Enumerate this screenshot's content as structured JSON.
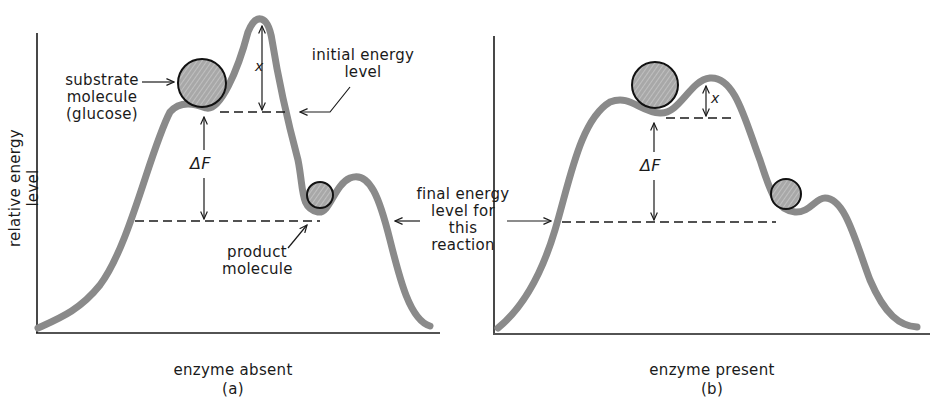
{
  "figure": {
    "y_axis_label": "relative energy level",
    "panel_a": {
      "caption": "enzyme absent",
      "letter": "(a)",
      "labels": {
        "substrate_line1": "substrate",
        "substrate_line2": "molecule",
        "substrate_line3": "(glucose)",
        "initial_line1": "initial energy",
        "initial_line2": "level",
        "product_line1": "product",
        "product_line2": "molecule",
        "delta_f": "ΔF",
        "x": "x"
      }
    },
    "panel_b": {
      "caption": "enzyme present",
      "letter": "(b)",
      "labels": {
        "delta_f": "ΔF",
        "x": "x"
      }
    },
    "shared": {
      "final_line1": "final energy",
      "final_line2": "level for",
      "final_line3": "this",
      "final_line4": "reaction"
    },
    "colors": {
      "curve": "#8a8a8a",
      "molecule_fill": "#a9a9a9",
      "ink": "#1a1a1a"
    }
  }
}
